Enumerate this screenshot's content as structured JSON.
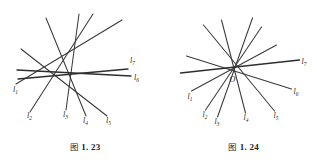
{
  "page": {
    "background": "#ffffff",
    "ink": "#231f20",
    "line_color": "#3a3a3c"
  },
  "figures": [
    {
      "id": "figure-1-23",
      "caption_prefix": "图",
      "caption_number": "1. 23",
      "caption_full": "图 1. 23",
      "description": "Seven straight lines in general position, no common point",
      "labels": [
        {
          "name": "l1",
          "base": "l",
          "sub": "1",
          "x": 13,
          "y": 92
        },
        {
          "name": "l2",
          "base": "l",
          "sub": "2",
          "x": 27,
          "y": 118
        },
        {
          "name": "l3",
          "base": "l",
          "sub": "3",
          "x": 63,
          "y": 117
        },
        {
          "name": "l4",
          "base": "l",
          "sub": "4",
          "x": 83,
          "y": 123
        },
        {
          "name": "l5",
          "base": "l",
          "sub": "5",
          "x": 106,
          "y": 123
        },
        {
          "name": "l6",
          "base": "l",
          "sub": "6",
          "x": 134,
          "y": 80
        },
        {
          "name": "l7",
          "base": "l",
          "sub": "7",
          "x": 130,
          "y": 63
        }
      ],
      "lines": [
        {
          "name": "l1",
          "x1": 16,
          "y1": 84,
          "x2": 122,
          "y2": 20,
          "weight": "normal"
        },
        {
          "name": "l2",
          "x1": 30,
          "y1": 112,
          "x2": 93,
          "y2": 14,
          "weight": "normal"
        },
        {
          "name": "l3",
          "x1": 66,
          "y1": 110,
          "x2": 79,
          "y2": 14,
          "weight": "normal"
        },
        {
          "name": "l4",
          "x1": 86,
          "y1": 116,
          "x2": 46,
          "y2": 18,
          "weight": "normal"
        },
        {
          "name": "l5",
          "x1": 107,
          "y1": 116,
          "x2": 21,
          "y2": 49,
          "weight": "normal"
        },
        {
          "name": "l6",
          "x1": 131,
          "y1": 76,
          "x2": 17,
          "y2": 70,
          "weight": "heavy"
        },
        {
          "name": "l7",
          "x1": 128,
          "y1": 69,
          "x2": 18,
          "y2": 79,
          "weight": "heavy"
        }
      ]
    },
    {
      "id": "figure-1-24",
      "caption_prefix": "图",
      "caption_number": "1. 24",
      "caption_full": "图 1. 24",
      "description": "Seven straight lines concurrent at a single point O",
      "center_point": {
        "name": "O",
        "label": "O",
        "x": 60,
        "y": 68,
        "label_x": 56,
        "label_y": 82
      },
      "labels": [
        {
          "name": "l1",
          "base": "l",
          "sub": "1",
          "x": 14,
          "y": 99
        },
        {
          "name": "l2",
          "base": "l",
          "sub": "2",
          "x": 29,
          "y": 117
        },
        {
          "name": "l3",
          "base": "l",
          "sub": "3",
          "x": 41,
          "y": 124
        },
        {
          "name": "l4",
          "base": "l",
          "sub": "4",
          "x": 70,
          "y": 120
        },
        {
          "name": "l5",
          "base": "l",
          "sub": "5",
          "x": 100,
          "y": 118
        },
        {
          "name": "l6",
          "base": "l",
          "sub": "6",
          "x": 120,
          "y": 94
        },
        {
          "name": "l7",
          "base": "l",
          "sub": "7",
          "x": 128,
          "y": 64
        }
      ],
      "lines": [
        {
          "name": "l1",
          "x1": 18,
          "y1": 91,
          "x2": 103,
          "y2": 45,
          "weight": "normal"
        },
        {
          "name": "l2",
          "x1": 32,
          "y1": 110,
          "x2": 88,
          "y2": 27,
          "weight": "normal"
        },
        {
          "name": "l3",
          "x1": 44,
          "y1": 117,
          "x2": 79,
          "y2": 18,
          "weight": "normal"
        },
        {
          "name": "l4",
          "x1": 72,
          "y1": 113,
          "x2": 48,
          "y2": 20,
          "weight": "normal"
        },
        {
          "name": "l5",
          "x1": 101,
          "y1": 111,
          "x2": 30,
          "y2": 25,
          "weight": "normal"
        },
        {
          "name": "l6",
          "x1": 118,
          "y1": 89,
          "x2": 13,
          "y2": 56,
          "weight": "normal"
        },
        {
          "name": "l7",
          "x1": 126,
          "y1": 60,
          "x2": 7,
          "y2": 73,
          "weight": "heavy"
        }
      ]
    }
  ]
}
